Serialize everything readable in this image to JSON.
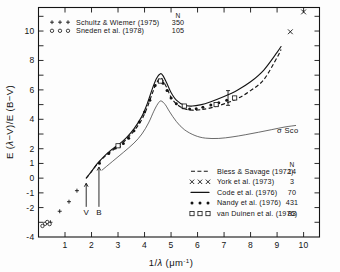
{
  "chart_data": {
    "type": "line",
    "title": "",
    "xlabel": "1/λ (μm⁻¹)",
    "ylabel": "E (λ−V)/E (B−V)",
    "xlim": [
      0,
      10.6
    ],
    "ylim": [
      -4,
      11.6
    ],
    "xticks": [
      1,
      2,
      3,
      4,
      5,
      6,
      7,
      8,
      9,
      10
    ],
    "xticklabels": [
      "1",
      "2",
      "3",
      "4",
      "5",
      "6",
      "7",
      "8",
      "9",
      "10"
    ],
    "yticks": [
      -4,
      -2,
      -1,
      0,
      1,
      2,
      4,
      6,
      8,
      10
    ],
    "yticklabels": [
      "-4",
      "-2",
      "-1",
      "0",
      "1",
      "2",
      "4",
      "6",
      "8",
      "10"
    ],
    "grid": false,
    "legend_position": "inner-lower-right",
    "annotations": [
      {
        "text": "σ Sco",
        "x": 9.0,
        "y": 3.1
      },
      {
        "text": "V",
        "x": 1.8,
        "y": -2.35
      },
      {
        "text": "B",
        "x": 2.28,
        "y": -2.35
      }
    ],
    "series": [
      {
        "name": "Bless & Savage (1972)",
        "n": "14",
        "style": "dashed",
        "marker": "none",
        "x": [
          1.8,
          2.0,
          2.2,
          2.4,
          2.7,
          3.0,
          3.3,
          3.6,
          3.9,
          4.1,
          4.3,
          4.45,
          4.6,
          4.7,
          4.85,
          5.0,
          5.2,
          5.5,
          5.8,
          6.1,
          6.5,
          7.0,
          7.5,
          8.0,
          8.5,
          9.0,
          9.15
        ],
        "y": [
          0.0,
          0.45,
          0.92,
          1.3,
          1.78,
          2.15,
          2.62,
          3.2,
          4.0,
          4.8,
          5.8,
          6.45,
          6.8,
          6.62,
          6.1,
          5.5,
          5.05,
          4.72,
          4.62,
          4.65,
          4.78,
          5.05,
          5.4,
          5.95,
          6.7,
          8.2,
          8.75
        ]
      },
      {
        "name": "York et al. (1973)",
        "n": "3",
        "style": "points",
        "marker": "cross-x",
        "x": [
          9.5,
          10.0
        ],
        "y": [
          9.95,
          11.3
        ]
      },
      {
        "name": "Code et al. (1976)",
        "n": "70",
        "style": "solid",
        "marker": "none",
        "x": [
          1.8,
          2.0,
          2.2,
          2.4,
          2.7,
          3.0,
          3.3,
          3.6,
          3.9,
          4.1,
          4.3,
          4.45,
          4.6,
          4.7,
          4.85,
          5.0,
          5.2,
          5.5,
          5.8,
          6.1,
          6.5,
          7.0,
          7.5,
          8.0,
          8.5,
          9.0,
          9.15
        ],
        "y": [
          0.0,
          0.46,
          0.95,
          1.35,
          1.85,
          2.25,
          2.72,
          3.35,
          4.2,
          5.05,
          6.1,
          6.78,
          7.1,
          6.95,
          6.42,
          5.82,
          5.3,
          4.95,
          4.9,
          4.98,
          5.2,
          5.55,
          5.98,
          6.55,
          7.35,
          8.55,
          8.95
        ]
      },
      {
        "name": "Nandy et al. (1976)",
        "n": "431",
        "style": "points",
        "marker": "filled-dot",
        "x": [
          2.3,
          2.65,
          2.9,
          3.05,
          3.2,
          3.4,
          3.6,
          3.8,
          4.0,
          4.2,
          4.4,
          4.55,
          4.7,
          4.85,
          5.0,
          5.2,
          5.45,
          5.7,
          5.95,
          6.2,
          6.5,
          6.8,
          7.1,
          7.4
        ],
        "y": [
          1.02,
          1.68,
          2.05,
          2.16,
          2.35,
          2.72,
          3.22,
          3.82,
          4.5,
          5.3,
          6.3,
          6.65,
          6.45,
          5.95,
          5.45,
          5.05,
          4.78,
          4.7,
          4.72,
          4.82,
          4.98,
          5.12,
          5.3,
          5.5
        ]
      },
      {
        "name": "van Duinen et al. (1976)",
        "n": "83",
        "style": "points",
        "marker": "open-square",
        "x": [
          3.0,
          4.6,
          5.5,
          6.7,
          7.4
        ],
        "y": [
          2.2,
          6.6,
          4.9,
          5.0,
          5.45
        ]
      },
      {
        "name": "Schultz & Wiemer (1975)",
        "n": "350",
        "style": "points",
        "marker": "plus",
        "x": [
          0.45,
          0.8,
          1.15,
          1.45
        ],
        "y": [
          -3.0,
          -2.25,
          -1.6,
          -0.85
        ]
      },
      {
        "name": "Sneden et al. (1978)",
        "n": "105",
        "style": "points",
        "marker": "open-circle",
        "x": [
          0.15,
          0.25,
          0.33,
          0.42
        ],
        "y": [
          -3.25,
          -3.1,
          -2.98,
          -3.12
        ]
      },
      {
        "name": "sigma Sco",
        "n": "",
        "style": "thin-solid",
        "marker": "none",
        "x": [
          2.4,
          2.8,
          3.2,
          3.6,
          3.9,
          4.15,
          4.35,
          4.5,
          4.62,
          4.78,
          4.95,
          5.2,
          5.5,
          5.9,
          6.3,
          6.8,
          7.3,
          7.8,
          8.3,
          8.8,
          9.3,
          9.7
        ],
        "y": [
          0.55,
          1.15,
          1.75,
          2.38,
          3.0,
          3.75,
          4.55,
          5.05,
          5.25,
          5.0,
          4.5,
          3.85,
          3.3,
          2.9,
          2.72,
          2.7,
          2.8,
          2.95,
          3.12,
          3.3,
          3.48,
          3.58
        ]
      }
    ]
  },
  "legend_top": {
    "n_header": "N",
    "entries": [
      {
        "marker": "plus",
        "label": "Schultz & Wiemer (1975)",
        "n": "350"
      },
      {
        "marker": "open-circle",
        "label": "Sneden et al. (1978)",
        "n": "105"
      }
    ]
  },
  "legend_bottom": {
    "n_header": "N",
    "entries": [
      {
        "marker": "dashed-line",
        "label": "Bless & Savage (1972)",
        "n": "14"
      },
      {
        "marker": "cross-x",
        "label": "York et al. (1973)",
        "n": "3"
      },
      {
        "marker": "solid-line",
        "label": "Code et al. (1976)",
        "n": "70"
      },
      {
        "marker": "filled-dot",
        "label": "Nandy et al. (1976)",
        "n": "431"
      },
      {
        "marker": "open-square",
        "label": "van Duinen et al. (1976)",
        "n": "83"
      }
    ]
  },
  "axes": {
    "ylabel": "E (λ−V)/E (B−V)",
    "xlabel": "1/λ (μm⁻¹)"
  },
  "colors": {
    "ink": "#141414",
    "thin": "#3a3a3a",
    "background": "#fdfdfd"
  }
}
